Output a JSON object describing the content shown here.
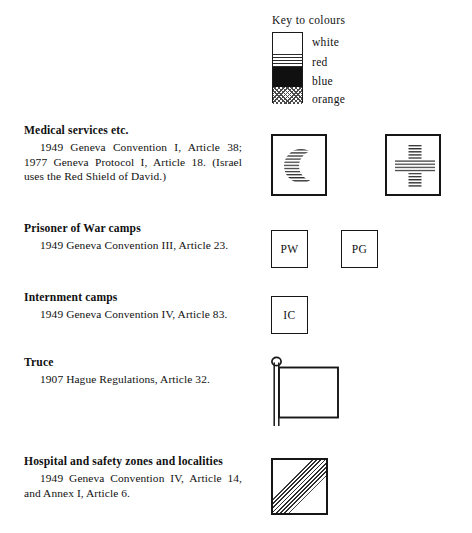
{
  "key": {
    "title": "Key to colours",
    "entries": [
      {
        "name": "white",
        "label": "white",
        "pattern": "blank",
        "hex": "#ffffff"
      },
      {
        "name": "red",
        "label": "red",
        "pattern": "horizontal-lines",
        "hex": "#cc0000"
      },
      {
        "name": "blue",
        "label": "blue",
        "pattern": "solid-black",
        "hex": "#000000"
      },
      {
        "name": "orange",
        "label": "orange",
        "pattern": "cross-hatch-dots",
        "hex": "#ff8800"
      }
    ]
  },
  "entries": [
    {
      "id": "medical-services",
      "heading": "Medical services etc.",
      "citation": "1949 Geneva Convention I, Article 38; 1977 Geneva Protocol I, Article 18. (Israel uses the Red Shield of David.)",
      "symbols": [
        {
          "name": "red-crescent-symbol",
          "kind": "crescent"
        },
        {
          "name": "red-cross-symbol",
          "kind": "cross"
        }
      ]
    },
    {
      "id": "prisoner-of-war-camps",
      "heading": "Prisoner of War camps",
      "citation": "1949 Geneva Convention III, Article 23.",
      "symbols": [
        {
          "name": "pw-marking",
          "kind": "letters",
          "text": "PW"
        },
        {
          "name": "pg-marking",
          "kind": "letters",
          "text": "PG"
        }
      ]
    },
    {
      "id": "internment-camps",
      "heading": "Internment camps",
      "citation": "1949 Geneva Convention IV, Article 83.",
      "symbols": [
        {
          "name": "ic-marking",
          "kind": "letters",
          "text": "IC"
        }
      ]
    },
    {
      "id": "truce",
      "heading": "Truce",
      "citation": "1907 Hague Regulations, Article 32.",
      "symbols": [
        {
          "name": "white-flag-symbol",
          "kind": "flag"
        }
      ]
    },
    {
      "id": "hospital-and-safety-zones",
      "heading": "Hospital and safety zones and localities",
      "citation": "1949 Geneva Convention IV, Article 14, and Annex I, Article 6.",
      "symbols": [
        {
          "name": "hospital-zone-symbol",
          "kind": "diagonal-band"
        }
      ]
    }
  ]
}
